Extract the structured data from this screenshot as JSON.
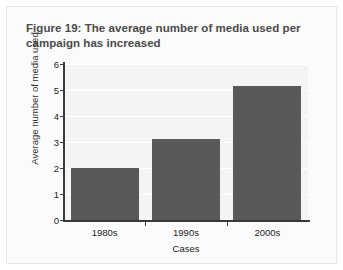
{
  "figure": {
    "title_line1": "Figure 19: The average number of media used",
    "title_line2": "per campaign has increased"
  },
  "chart_data": {
    "type": "bar",
    "title": "Figure 19: The average number of media used per campaign has increased",
    "categories": [
      "1980s",
      "1990s",
      "2000s"
    ],
    "values": [
      2.0,
      3.1,
      5.15
    ],
    "xlabel": "Cases",
    "ylabel": "Average number of media used",
    "ylim": [
      0,
      6
    ],
    "yticks": [
      0,
      1,
      2,
      3,
      4,
      5,
      6
    ],
    "ytick_labels": [
      "0",
      "1",
      "2",
      "3",
      "4",
      "5",
      "6"
    ],
    "grid": true,
    "legend": false,
    "bar_color": "#595959",
    "plot_background": "#f4f4f4",
    "gridline_color": "#ffffff",
    "axis_color": "#3a3a3a"
  }
}
